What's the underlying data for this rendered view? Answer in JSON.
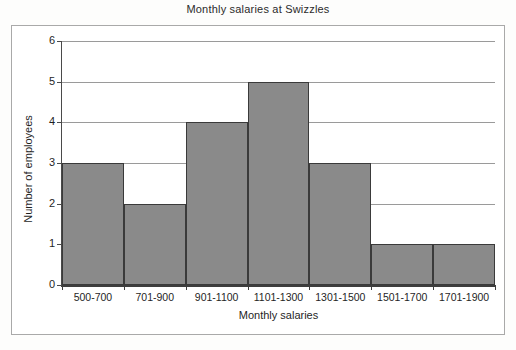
{
  "chart_data": {
    "type": "bar",
    "title": "Monthly salaries at Swizzles",
    "xlabel": "Monthly salaries",
    "ylabel": "Number of employees",
    "categories": [
      "500-700",
      "701-900",
      "901-1100",
      "1101-1300",
      "1301-1500",
      "1501-1700",
      "1701-1900"
    ],
    "values": [
      3,
      2,
      4,
      5,
      3,
      1,
      1
    ],
    "ylim": [
      0,
      6
    ],
    "yticks": [
      0,
      1,
      2,
      3,
      4,
      5,
      6
    ],
    "ytick_labels": [
      "0",
      "1",
      "2",
      "3",
      "4",
      "5",
      "6"
    ],
    "grid": true,
    "legend": null,
    "bar_color": "#8a8a8a",
    "bar_edge_color": "#3a3a3a",
    "gridline_color": "#9a9a9a",
    "axis_color": "#3d3d3d",
    "frame_color": "#a9a9a9",
    "background_color": "#ffffff",
    "bars_contiguous": true
  }
}
